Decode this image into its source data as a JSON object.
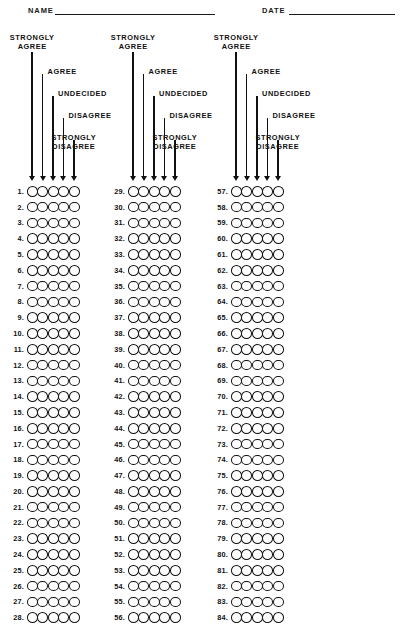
{
  "form": {
    "title": "Likert Scale Survey Answer Sheet",
    "header": {
      "name_label": "NAME",
      "date_label": "DATE",
      "name_value": "",
      "date_value": ""
    },
    "scale": {
      "options": [
        "STRONGLY AGREE",
        "AGREE",
        "UNDECIDED",
        "DISAGREE",
        "STRONGLY DISAGREE"
      ],
      "legend_lines": [
        [
          "STRONGLY",
          "AGREE"
        ],
        [
          "AGREE"
        ],
        [
          "UNDECIDED"
        ],
        [
          "DISAGREE"
        ],
        [
          "STRONGLY",
          "DISAGREE"
        ]
      ],
      "option_count": 5
    },
    "grid": {
      "columns": [
        {
          "first_item": 1,
          "last_item": 28,
          "numbers": [
            1,
            2,
            3,
            4,
            5,
            6,
            7,
            8,
            9,
            10,
            11,
            12,
            13,
            14,
            15,
            16,
            17,
            18,
            19,
            20,
            21,
            22,
            23,
            24,
            25,
            26,
            27,
            28
          ]
        },
        {
          "first_item": 29,
          "last_item": 56,
          "numbers": [
            29,
            30,
            31,
            32,
            33,
            34,
            35,
            36,
            37,
            38,
            39,
            40,
            41,
            42,
            43,
            44,
            45,
            46,
            47,
            48,
            49,
            50,
            51,
            52,
            53,
            54,
            55,
            56
          ]
        },
        {
          "first_item": 57,
          "last_item": 84,
          "numbers": [
            57,
            58,
            59,
            60,
            61,
            62,
            63,
            64,
            65,
            66,
            67,
            68,
            69,
            70,
            71,
            72,
            73,
            74,
            75,
            76,
            77,
            78,
            79,
            80,
            81,
            82,
            83,
            84
          ]
        }
      ],
      "rows_per_column": 28,
      "total_items": 84,
      "number_suffix": "."
    },
    "colors": {
      "ink": "#111111",
      "paper": "#ffffff"
    }
  }
}
